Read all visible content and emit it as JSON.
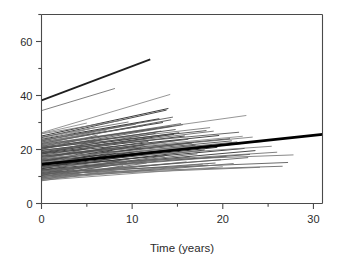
{
  "chart_data": {
    "type": "line",
    "title": "",
    "subtitle": "",
    "xlabel": "Time (years)",
    "ylabel": "",
    "xlim": [
      0,
      31
    ],
    "ylim": [
      0,
      70
    ],
    "grid": false,
    "legend": "none",
    "x_ticks": [
      0,
      10,
      20,
      30
    ],
    "x_ticklabels": [
      "0",
      "10",
      "20",
      "30"
    ],
    "x_minor_ticks": [
      5,
      15,
      25
    ],
    "y_ticks": [
      0,
      20,
      40,
      60
    ],
    "y_ticklabels": [
      "0",
      "20",
      "40",
      "60"
    ],
    "y_minor_ticks": [
      10,
      30,
      50,
      70
    ],
    "colors": {
      "background": "#ffffff",
      "axis": "#4a4a4a",
      "text": "#2b2b2b",
      "average_line": "#000000",
      "subject_line_dark": "#3c3c3c",
      "subject_line_light": "#9a9a9a"
    },
    "average_series": {
      "name": "Population average",
      "x": [
        0,
        31
      ],
      "values": [
        14.5,
        25.6
      ],
      "intercept": 14.5,
      "slope": 0.358,
      "width": 2.6,
      "color": "#000000"
    },
    "series": [
      {
        "name": "s1",
        "x": [
          0,
          12
        ],
        "values": [
          38.2,
          53.4
        ],
        "color": "#1f1f1f",
        "width": 1.8
      },
      {
        "name": "s2",
        "x": [
          0,
          8.1
        ],
        "values": [
          34.4,
          42.6
        ],
        "color": "#6f6f6f",
        "width": 0.9
      },
      {
        "name": "s3",
        "x": [
          0,
          14.2
        ],
        "values": [
          26.2,
          40.4
        ],
        "color": "#8a8a8a",
        "width": 0.9
      },
      {
        "name": "s4",
        "x": [
          0,
          22.6
        ],
        "values": [
          22.0,
          32.6
        ],
        "color": "#8a8a8a",
        "width": 0.9
      },
      {
        "name": "s5",
        "x": [
          0,
          14.0
        ],
        "values": [
          25.0,
          35.2
        ],
        "color": "#3c3c3c",
        "width": 1.0
      },
      {
        "name": "s6",
        "x": [
          0,
          13.8
        ],
        "values": [
          24.4,
          34.6
        ],
        "color": "#4a4a4a",
        "width": 1.0
      },
      {
        "name": "s7",
        "x": [
          0,
          14.5
        ],
        "values": [
          23.4,
          32.0
        ],
        "color": "#5a5a5a",
        "width": 0.9
      },
      {
        "name": "s8",
        "x": [
          0,
          14.3
        ],
        "values": [
          22.2,
          31.0
        ],
        "color": "#4f4f4f",
        "width": 0.9
      },
      {
        "name": "s9",
        "x": [
          0,
          15.4
        ],
        "values": [
          21.4,
          29.6
        ],
        "color": "#6a6a6a",
        "width": 0.9
      },
      {
        "name": "s10",
        "x": [
          0,
          15.6
        ],
        "values": [
          20.4,
          29.2
        ],
        "color": "#5e5e5e",
        "width": 0.9
      },
      {
        "name": "s11",
        "x": [
          0,
          18.6
        ],
        "values": [
          21.0,
          28.1
        ],
        "color": "#7a7a7a",
        "width": 0.9
      },
      {
        "name": "s12",
        "x": [
          0,
          19.0
        ],
        "values": [
          19.2,
          26.8
        ],
        "color": "#6d6d6d",
        "width": 0.9
      },
      {
        "name": "s13",
        "x": [
          0,
          22.2
        ],
        "values": [
          18.0,
          24.9
        ],
        "color": "#8f8f8f",
        "width": 0.9
      },
      {
        "name": "s14",
        "x": [
          0,
          23.3
        ],
        "values": [
          17.2,
          24.6
        ],
        "color": "#7f7f7f",
        "width": 0.9
      },
      {
        "name": "s15",
        "x": [
          0,
          27.8
        ],
        "values": [
          14.6,
          18.0
        ],
        "color": "#7c7c7c",
        "width": 0.9
      },
      {
        "name": "s16",
        "x": [
          0,
          27.2
        ],
        "values": [
          11.6,
          15.2
        ],
        "color": "#5b5b5b",
        "width": 0.9
      },
      {
        "name": "s17",
        "x": [
          0,
          26.6
        ],
        "values": [
          11.0,
          13.8
        ],
        "color": "#6b6b6b",
        "width": 0.9
      },
      {
        "name": "s18",
        "x": [
          0,
          24.1
        ],
        "values": [
          10.2,
          13.4
        ],
        "color": "#777777",
        "width": 0.9
      },
      {
        "name": "s19",
        "x": [
          0,
          23.0
        ],
        "values": [
          12.4,
          18.2
        ],
        "color": "#4b4b4b",
        "width": 0.9
      },
      {
        "name": "s20",
        "x": [
          0,
          22.4
        ],
        "values": [
          13.6,
          20.4
        ],
        "color": "#3f3f3f",
        "width": 1.0
      },
      {
        "name": "s21",
        "x": [
          0,
          22.0
        ],
        "values": [
          14.8,
          22.2
        ],
        "color": "#454545",
        "width": 1.0
      },
      {
        "name": "s22",
        "x": [
          0,
          21.6
        ],
        "values": [
          15.8,
          22.8
        ],
        "color": "#585858",
        "width": 0.9
      },
      {
        "name": "s23",
        "x": [
          0,
          21.0
        ],
        "values": [
          16.6,
          23.2
        ],
        "color": "#4e4e4e",
        "width": 0.9
      },
      {
        "name": "s24",
        "x": [
          0,
          20.4
        ],
        "values": [
          12.0,
          17.4
        ],
        "color": "#666666",
        "width": 0.9
      },
      {
        "name": "s25",
        "x": [
          0,
          19.8
        ],
        "values": [
          11.2,
          16.2
        ],
        "color": "#727272",
        "width": 0.9
      },
      {
        "name": "s26",
        "x": [
          0,
          19.2
        ],
        "values": [
          10.4,
          15.0
        ],
        "color": "#5c5c5c",
        "width": 0.9
      },
      {
        "name": "s27",
        "x": [
          0,
          18.4
        ],
        "values": [
          9.6,
          14.2
        ],
        "color": "#686868",
        "width": 0.9
      },
      {
        "name": "s28",
        "x": [
          0,
          18.0
        ],
        "values": [
          13.0,
          19.8
        ],
        "color": "#3a3a3a",
        "width": 1.0
      },
      {
        "name": "s29",
        "x": [
          0,
          17.4
        ],
        "values": [
          14.2,
          21.0
        ],
        "color": "#434343",
        "width": 1.0
      },
      {
        "name": "s30",
        "x": [
          0,
          17.0
        ],
        "values": [
          15.4,
          21.6
        ],
        "color": "#505050",
        "width": 0.9
      },
      {
        "name": "s31",
        "x": [
          0,
          16.6
        ],
        "values": [
          16.2,
          22.4
        ],
        "color": "#5f5f5f",
        "width": 0.9
      },
      {
        "name": "s32",
        "x": [
          0,
          16.2
        ],
        "values": [
          17.4,
          23.8
        ],
        "color": "#4c4c4c",
        "width": 0.9
      },
      {
        "name": "s33",
        "x": [
          0,
          15.8
        ],
        "values": [
          18.6,
          25.0
        ],
        "color": "#424242",
        "width": 1.0
      },
      {
        "name": "s34",
        "x": [
          0,
          15.2
        ],
        "values": [
          19.6,
          26.2
        ],
        "color": "#3d3d3d",
        "width": 1.0
      },
      {
        "name": "s35",
        "x": [
          0,
          14.8
        ],
        "values": [
          20.8,
          27.4
        ],
        "color": "#484848",
        "width": 0.9
      },
      {
        "name": "s36",
        "x": [
          0,
          14.4
        ],
        "values": [
          21.8,
          28.6
        ],
        "color": "#545454",
        "width": 0.9
      },
      {
        "name": "s37",
        "x": [
          0,
          13.4
        ],
        "values": [
          22.8,
          30.0
        ],
        "color": "#464646",
        "width": 1.0
      },
      {
        "name": "s38",
        "x": [
          0,
          13.0
        ],
        "values": [
          23.8,
          31.4
        ],
        "color": "#3b3b3b",
        "width": 1.0
      },
      {
        "name": "s39",
        "x": [
          0,
          12.6
        ],
        "values": [
          19.0,
          26.0
        ],
        "color": "#565656",
        "width": 0.9
      },
      {
        "name": "s40",
        "x": [
          0,
          12.2
        ],
        "values": [
          17.8,
          24.4
        ],
        "color": "#626262",
        "width": 0.9
      },
      {
        "name": "s41",
        "x": [
          0,
          11.8
        ],
        "values": [
          16.8,
          23.0
        ],
        "color": "#4d4d4d",
        "width": 0.9
      },
      {
        "name": "s42",
        "x": [
          0,
          11.4
        ],
        "values": [
          15.6,
          21.8
        ],
        "color": "#414141",
        "width": 1.0
      },
      {
        "name": "s43",
        "x": [
          0,
          11.0
        ],
        "values": [
          14.4,
          20.6
        ],
        "color": "#373737",
        "width": 1.0
      },
      {
        "name": "s44",
        "x": [
          0,
          10.6
        ],
        "values": [
          13.2,
          19.4
        ],
        "color": "#3e3e3e",
        "width": 1.0
      },
      {
        "name": "s45",
        "x": [
          0,
          10.2
        ],
        "values": [
          12.2,
          18.0
        ],
        "color": "#4a4a4a",
        "width": 0.9
      },
      {
        "name": "s46",
        "x": [
          0,
          9.8
        ],
        "values": [
          11.0,
          16.6
        ],
        "color": "#555555",
        "width": 0.9
      },
      {
        "name": "s47",
        "x": [
          0,
          9.4
        ],
        "values": [
          9.8,
          15.2
        ],
        "color": "#616161",
        "width": 0.9
      },
      {
        "name": "s48",
        "x": [
          0,
          9.0
        ],
        "values": [
          8.8,
          14.0
        ],
        "color": "#6e6e6e",
        "width": 0.9
      },
      {
        "name": "s49",
        "x": [
          0,
          8.6
        ],
        "values": [
          10.4,
          15.8
        ],
        "color": "#4f4f4f",
        "width": 0.9
      },
      {
        "name": "s50",
        "x": [
          0,
          8.2
        ],
        "values": [
          12.8,
          18.6
        ],
        "color": "#393939",
        "width": 1.0
      },
      {
        "name": "s51",
        "x": [
          0,
          7.8
        ],
        "values": [
          14.0,
          19.6
        ],
        "color": "#404040",
        "width": 1.0
      },
      {
        "name": "s52",
        "x": [
          0,
          7.4
        ],
        "values": [
          15.2,
          20.8
        ],
        "color": "#4b4b4b",
        "width": 0.9
      },
      {
        "name": "s53",
        "x": [
          0,
          7.0
        ],
        "values": [
          16.4,
          22.0
        ],
        "color": "#575757",
        "width": 0.9
      },
      {
        "name": "s54",
        "x": [
          0,
          6.6
        ],
        "values": [
          18.2,
          23.6
        ],
        "color": "#636363",
        "width": 0.9
      },
      {
        "name": "s55",
        "x": [
          0,
          6.2
        ],
        "values": [
          20.0,
          25.4
        ],
        "color": "#6f6f6f",
        "width": 0.9
      },
      {
        "name": "s56",
        "x": [
          0,
          5.8
        ],
        "values": [
          21.6,
          26.6
        ],
        "color": "#7b7b7b",
        "width": 0.9
      },
      {
        "name": "s57",
        "x": [
          0,
          5.4
        ],
        "values": [
          23.0,
          27.8
        ],
        "color": "#878787",
        "width": 0.9
      },
      {
        "name": "s58",
        "x": [
          0,
          16.0
        ],
        "values": [
          10.0,
          15.4
        ],
        "color": "#6c6c6c",
        "width": 0.9
      },
      {
        "name": "s59",
        "x": [
          0,
          17.8
        ],
        "values": [
          9.2,
          14.6
        ],
        "color": "#787878",
        "width": 0.9
      },
      {
        "name": "s60",
        "x": [
          0,
          20.0
        ],
        "values": [
          8.6,
          13.6
        ],
        "color": "#848484",
        "width": 0.9
      },
      {
        "name": "s61",
        "x": [
          0,
          21.2
        ],
        "values": [
          9.0,
          14.8
        ],
        "color": "#707070",
        "width": 0.9
      },
      {
        "name": "s62",
        "x": [
          0,
          22.8
        ],
        "values": [
          10.8,
          17.0
        ],
        "color": "#5d5d5d",
        "width": 0.9
      },
      {
        "name": "s63",
        "x": [
          0,
          23.6
        ],
        "values": [
          12.6,
          19.6
        ],
        "color": "#494949",
        "width": 1.0
      },
      {
        "name": "s64",
        "x": [
          0,
          13.6
        ],
        "values": [
          11.4,
          17.6
        ],
        "color": "#535353",
        "width": 0.9
      },
      {
        "name": "s65",
        "x": [
          0,
          12.8
        ],
        "values": [
          10.6,
          16.4
        ],
        "color": "#5f5f5f",
        "width": 0.9
      },
      {
        "name": "s66",
        "x": [
          0,
          11.6
        ],
        "values": [
          9.4,
          15.0
        ],
        "color": "#6a6a6a",
        "width": 0.9
      },
      {
        "name": "s67",
        "x": [
          0,
          10.8
        ],
        "values": [
          8.4,
          13.8
        ],
        "color": "#767676",
        "width": 0.9
      },
      {
        "name": "s68",
        "x": [
          0,
          19.4
        ],
        "values": [
          13.8,
          20.8
        ],
        "color": "#3c3c3c",
        "width": 1.0
      },
      {
        "name": "s69",
        "x": [
          0,
          18.8
        ],
        "values": [
          15.0,
          21.6
        ],
        "color": "#444444",
        "width": 1.0
      },
      {
        "name": "s70",
        "x": [
          0,
          16.8
        ],
        "values": [
          16.0,
          22.6
        ],
        "color": "#505050",
        "width": 0.9
      },
      {
        "name": "s71",
        "x": [
          0,
          15.0
        ],
        "values": [
          17.0,
          23.4
        ],
        "color": "#5a5a5a",
        "width": 0.9
      },
      {
        "name": "s72",
        "x": [
          0,
          14.6
        ],
        "values": [
          18.8,
          25.6
        ],
        "color": "#474747",
        "width": 1.0
      },
      {
        "name": "s73",
        "x": [
          0,
          13.2
        ],
        "values": [
          20.2,
          26.8
        ],
        "color": "#515151",
        "width": 0.9
      },
      {
        "name": "s74",
        "x": [
          0,
          12.4
        ],
        "values": [
          21.2,
          27.6
        ],
        "color": "#5b5b5b",
        "width": 0.9
      },
      {
        "name": "s75",
        "x": [
          0,
          11.2
        ],
        "values": [
          22.4,
          28.8
        ],
        "color": "#656565",
        "width": 0.9
      },
      {
        "name": "s76",
        "x": [
          0,
          9.6
        ],
        "values": [
          24.6,
          30.2
        ],
        "color": "#717171",
        "width": 0.9
      },
      {
        "name": "s77",
        "x": [
          0,
          8.8
        ],
        "values": [
          25.8,
          30.8
        ],
        "color": "#7d7d7d",
        "width": 0.9
      },
      {
        "name": "s78",
        "x": [
          0,
          24.6
        ],
        "values": [
          16.8,
          23.0
        ],
        "color": "#8b8b8b",
        "width": 0.9
      },
      {
        "name": "s79",
        "x": [
          0,
          25.4
        ],
        "values": [
          15.4,
          21.2
        ],
        "color": "#818181",
        "width": 0.9
      },
      {
        "name": "s80",
        "x": [
          0,
          26.0
        ],
        "values": [
          13.4,
          19.0
        ],
        "color": "#747474",
        "width": 0.9
      },
      {
        "name": "s81",
        "x": [
          0,
          20.8
        ],
        "values": [
          17.6,
          24.0
        ],
        "color": "#4e4e4e",
        "width": 0.9
      },
      {
        "name": "s82",
        "x": [
          0,
          19.6
        ],
        "values": [
          18.4,
          25.2
        ],
        "color": "#464646",
        "width": 1.0
      },
      {
        "name": "s83",
        "x": [
          0,
          17.2
        ],
        "values": [
          12.0,
          18.4
        ],
        "color": "#5e5e5e",
        "width": 0.9
      },
      {
        "name": "s84",
        "x": [
          0,
          16.4
        ],
        "values": [
          11.8,
          17.2
        ],
        "color": "#686868",
        "width": 0.9
      },
      {
        "name": "s85",
        "x": [
          0,
          21.8
        ],
        "values": [
          19.8,
          26.4
        ],
        "color": "#585858",
        "width": 0.9
      },
      {
        "name": "s86",
        "x": [
          0,
          10.4
        ],
        "values": [
          23.2,
          29.4
        ],
        "color": "#626262",
        "width": 0.9
      },
      {
        "name": "s87",
        "x": [
          0,
          6.0
        ],
        "values": [
          24.0,
          28.2
        ],
        "color": "#8d8d8d",
        "width": 0.9
      },
      {
        "name": "s88",
        "x": [
          0,
          7.2
        ],
        "values": [
          22.6,
          27.2
        ],
        "color": "#838383",
        "width": 0.9
      },
      {
        "name": "s89",
        "x": [
          0,
          5.0
        ],
        "values": [
          26.0,
          29.8
        ],
        "color": "#909090",
        "width": 0.9
      },
      {
        "name": "s90",
        "x": [
          0,
          18.2
        ],
        "values": [
          20.6,
          27.0
        ],
        "color": "#4c4c4c",
        "width": 0.9
      }
    ]
  }
}
